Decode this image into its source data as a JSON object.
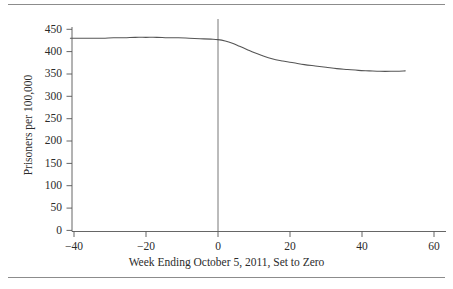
{
  "figure": {
    "background_color": "#ffffff",
    "rule_color": "#8c8c8c",
    "text_color": "#2b2b2b",
    "line_color": "#555555"
  },
  "chart_data": {
    "type": "line",
    "title": "",
    "subtitle": "",
    "xlabel": "Week Ending October 5, 2011, Set to Zero",
    "ylabel": "Prisoners per 100,000",
    "xlim": [
      -44,
      62
    ],
    "ylim": [
      0,
      465
    ],
    "xticks": [
      -40,
      -20,
      0,
      20,
      40,
      60
    ],
    "xticklabels": [
      "−40",
      "−20",
      "0",
      "20",
      "40",
      "60"
    ],
    "yticks": [
      0,
      50,
      100,
      150,
      200,
      250,
      300,
      350,
      400,
      450
    ],
    "yticklabels": [
      "0",
      "50",
      "100",
      "150",
      "200",
      "250",
      "300",
      "350",
      "400",
      "450"
    ],
    "grid": false,
    "legend": null,
    "annotations": [
      {
        "name": "vertical-reference-line",
        "type": "vline",
        "x": 0,
        "y_from": 0,
        "y_to": 465,
        "color": "#555555"
      }
    ],
    "series": [
      {
        "name": "Prisoners per 100,000",
        "color": "#555555",
        "x": [
          -41,
          -38,
          -35,
          -32,
          -29,
          -26,
          -23,
          -20,
          -17,
          -14,
          -11,
          -8,
          -5,
          -2,
          0,
          2,
          4,
          6,
          8,
          10,
          12,
          15,
          18,
          21,
          24,
          27,
          30,
          33,
          36,
          39,
          42,
          45,
          48,
          52
        ],
        "values": [
          430,
          430,
          430,
          430,
          431,
          431,
          432,
          432,
          432,
          431,
          431,
          430,
          429,
          428,
          427,
          424,
          419,
          412,
          405,
          398,
          392,
          384,
          379,
          375,
          371,
          368,
          365,
          362,
          360,
          358,
          357,
          356,
          356,
          357
        ]
      }
    ]
  },
  "axis_labels": {
    "y": [
      "450",
      "400",
      "350",
      "300",
      "250",
      "200",
      "150",
      "100",
      "50",
      "0"
    ],
    "x": [
      "−40",
      "−20",
      "0",
      "20",
      "40",
      "60"
    ]
  }
}
